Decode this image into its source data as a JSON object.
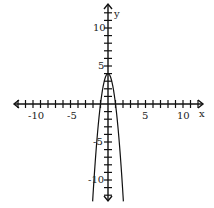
{
  "chart_data": {
    "type": "line",
    "title": "",
    "xlabel": "x",
    "ylabel": "y",
    "xlim": [
      -12,
      12
    ],
    "ylim": [
      -12,
      12
    ],
    "grid": false,
    "x_tick_labels": [
      "-10",
      "-5",
      "5",
      "10"
    ],
    "y_tick_labels": [
      "10",
      "5",
      "-5",
      "-10"
    ],
    "series": [
      {
        "name": "parabola",
        "equation": "y = -4x^2 + 4",
        "vertex": [
          0,
          4
        ],
        "x_intercepts": [
          -1,
          1
        ],
        "x": [
          -2,
          -1.5,
          -1,
          -0.5,
          0,
          0.5,
          1,
          1.5,
          2
        ],
        "y": [
          -12,
          -5,
          0,
          3,
          4,
          3,
          0,
          -5,
          -12
        ]
      }
    ]
  },
  "labels": {
    "x_axis": "x",
    "y_axis": "y",
    "x_neg10": "-10",
    "x_neg5": "-5",
    "x_5": "5",
    "x_10": "10",
    "y_10": "10",
    "y_5": "5",
    "y_neg5": "-5",
    "y_neg10": "-10"
  }
}
